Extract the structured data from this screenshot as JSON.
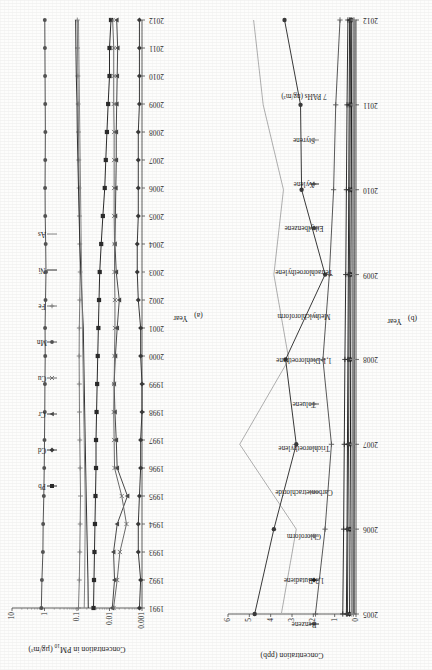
{
  "page": {
    "background": "#fdfdfc",
    "rotation_note": "figure rotated 90 degrees counter-clockwise on the scanned page"
  },
  "chart_data": [
    {
      "id": "a",
      "type": "line",
      "panel_tag": "(a)",
      "title": "",
      "xlabel": "Year",
      "ylabel": "Concentration in PM10 (µg/m³)",
      "yscale": "log",
      "ylim": [
        0.001,
        10
      ],
      "ytick_labels": [
        "10",
        "1",
        "0.1",
        "0.01",
        "0.001"
      ],
      "ytick_values": [
        10,
        1,
        0.1,
        0.01,
        0.001
      ],
      "grid": false,
      "legend_position": "top",
      "categories": [
        1991,
        1992,
        1993,
        1994,
        1995,
        1996,
        1997,
        1998,
        1999,
        2000,
        2001,
        2002,
        2003,
        2004,
        2005,
        2006,
        2007,
        2008,
        2009,
        2010,
        2011,
        2012
      ],
      "series": [
        {
          "name": "Pb",
          "color": "#2b2b2b",
          "marker": "square-filled",
          "values": [
            0.031,
            0.03,
            0.029,
            0.028,
            0.027,
            0.026,
            0.026,
            0.025,
            0.024,
            0.023,
            0.022,
            0.021,
            0.02,
            0.018,
            0.016,
            0.014,
            0.013,
            0.012,
            0.011,
            0.01,
            0.01,
            0.009
          ]
        },
        {
          "name": "Cd",
          "color": "#3a3a3a",
          "marker": "diamond-filled",
          "values": [
            0.0012,
            0.0011,
            0.0013,
            0.0013,
            0.0012,
            0.0011,
            0.0011,
            0.001,
            0.001,
            0.0011,
            0.0011,
            0.0013,
            0.0014,
            0.0014,
            0.0013,
            0.0013,
            0.0013,
            0.0013,
            0.0012,
            0.0012,
            0.0012,
            0.0012
          ]
        },
        {
          "name": "Cr",
          "color": "#4a4a4a",
          "marker": "triangle-filled",
          "values": [
            0.0082,
            0.007,
            0.0075,
            0.0058,
            0.0028,
            0.0058,
            0.0062,
            0.0068,
            0.0072,
            0.0066,
            0.0058,
            0.005,
            0.0062,
            0.0068,
            0.0066,
            0.0064,
            0.0062,
            0.0062,
            0.006,
            0.0058,
            0.0056,
            0.006
          ]
        },
        {
          "name": "Cu",
          "color": "#6b6b6b",
          "marker": "cross",
          "values": [
            0.0075,
            0.0058,
            0.0048,
            0.003,
            0.0042,
            0.007,
            0.0072,
            0.0074,
            0.0072,
            0.007,
            0.0068,
            0.0068,
            0.007,
            0.007,
            0.0072,
            0.0072,
            0.0072,
            0.0072,
            0.0074,
            0.0074,
            0.0074,
            0.008
          ]
        },
        {
          "name": "Mn",
          "color": "#545454",
          "marker": "circle-filled",
          "values": [
            1.25,
            1.2,
            1.12,
            1.1,
            1.05,
            1.02,
            1.0,
            0.98,
            0.97,
            0.95,
            0.96,
            0.93,
            0.9,
            0.92,
            0.95,
            0.96,
            0.95,
            0.94,
            0.95,
            0.96,
            0.97,
            0.98
          ]
        },
        {
          "name": "Fe",
          "color": "#7a7a7a",
          "marker": "plus",
          "values": [
            0.09,
            0.085,
            0.082,
            0.08,
            0.078,
            0.08,
            0.082,
            0.084,
            0.085,
            0.086,
            0.085,
            0.082,
            0.08,
            0.082,
            0.084,
            0.086,
            0.088,
            0.09,
            0.092,
            0.094,
            0.096,
            0.098
          ]
        },
        {
          "name": "Ni",
          "color": "#333333",
          "marker": "line",
          "values": [
            0.045,
            0.046,
            0.048,
            0.05,
            0.052,
            0.054,
            0.056,
            0.058,
            0.06,
            0.062,
            0.064,
            0.07,
            0.076,
            0.082,
            0.086,
            0.09,
            0.094,
            0.098,
            0.1,
            0.105,
            0.108,
            0.11
          ]
        },
        {
          "name": "As",
          "color": "#888888",
          "marker": "line",
          "values": [
            0.06,
            0.058,
            0.057,
            0.056,
            0.056,
            0.058,
            0.06,
            0.062,
            0.064,
            0.066,
            0.068,
            0.07,
            0.072,
            0.074,
            0.076,
            0.078,
            0.08,
            0.082,
            0.084,
            0.086,
            0.088,
            0.09
          ]
        }
      ]
    },
    {
      "id": "b",
      "type": "line",
      "panel_tag": "(b)",
      "title": "",
      "xlabel": "Year",
      "ylabel": "Concentration (ppb)",
      "yscale": "linear",
      "ylim": [
        0,
        6
      ],
      "ytick_labels": [
        "0",
        "1",
        "2",
        "3",
        "4",
        "5",
        "6"
      ],
      "ytick_values": [
        0,
        1,
        2,
        3,
        4,
        5,
        6
      ],
      "grid": false,
      "legend_position": "top",
      "categories": [
        2005,
        2006,
        2007,
        2008,
        2009,
        2010,
        2011,
        2012
      ],
      "series": [
        {
          "name": "Benzene",
          "color": "#2b2b2b",
          "marker": "plus",
          "values": [
            0.45,
            0.42,
            0.4,
            0.38,
            0.36,
            0.34,
            0.32,
            0.3
          ]
        },
        {
          "name": "1,3-Butadiene",
          "color": "#1f1f1f",
          "marker": "diamond-filled",
          "values": [
            0.3,
            0.28,
            0.26,
            0.25,
            0.24,
            0.22,
            0.21,
            0.2
          ]
        },
        {
          "name": "Chloroform",
          "color": "#6e6e6e",
          "marker": "plus",
          "values": [
            0.12,
            0.12,
            0.11,
            0.11,
            0.1,
            0.1,
            0.1,
            0.09
          ]
        },
        {
          "name": "Carbontetrachloride",
          "color": "#4b4b4b",
          "marker": "line",
          "values": [
            0.1,
            0.1,
            0.1,
            0.1,
            0.1,
            0.1,
            0.1,
            0.1
          ]
        },
        {
          "name": "Trichloroethylene",
          "color": "#8a8a8a",
          "marker": "line",
          "values": [
            0.22,
            0.2,
            0.18,
            0.16,
            0.15,
            0.14,
            0.13,
            0.12
          ]
        },
        {
          "name": "Toluene",
          "color": "#595959",
          "marker": "plus",
          "values": [
            1.9,
            1.45,
            1.15,
            1.55,
            1.25,
            1.05,
            0.95,
            0.75
          ]
        },
        {
          "name": "1,1-Dichloroethane",
          "color": "#5f5f5f",
          "marker": "line",
          "values": [
            0.08,
            0.08,
            0.07,
            0.07,
            0.06,
            0.06,
            0.06,
            0.05
          ]
        },
        {
          "name": "Methylchloroform",
          "color": "#777777",
          "marker": "line",
          "values": [
            0.14,
            0.12,
            0.1,
            0.09,
            0.08,
            0.07,
            0.06,
            0.05
          ]
        },
        {
          "name": "Tetrachloroethylene",
          "color": "#9a9a9a",
          "marker": "line",
          "values": [
            0.18,
            0.16,
            0.14,
            0.13,
            0.12,
            0.11,
            0.1,
            0.09
          ]
        },
        {
          "name": "Ethylbenzene",
          "color": "#3d3d3d",
          "marker": "diamond-filled",
          "values": [
            0.4,
            0.38,
            0.35,
            0.33,
            0.31,
            0.29,
            0.27,
            0.25
          ]
        },
        {
          "name": "Xylene",
          "color": "#2f2f2f",
          "marker": "plus",
          "values": [
            0.62,
            0.58,
            0.55,
            0.52,
            0.48,
            0.45,
            0.42,
            0.38
          ]
        },
        {
          "name": "Styrene",
          "color": "#8f8f8f",
          "marker": "plus",
          "values": [
            0.2,
            0.19,
            0.18,
            0.17,
            0.16,
            0.15,
            0.14,
            0.13
          ]
        },
        {
          "name": "7 PAHs (ng/m³)",
          "color": "#b0b0b0",
          "marker": "line",
          "values": [
            3.5,
            2.8,
            5.45,
            3.15,
            3.85,
            3.4,
            4.35,
            4.8
          ]
        }
      ],
      "extra_series": [
        {
          "name": "Toluene-high",
          "color": "#3a3a3a",
          "marker": "circle-filled",
          "values": [
            4.75,
            3.85,
            2.8,
            3.3,
            1.45,
            2.55,
            2.6,
            3.35
          ]
        }
      ]
    }
  ]
}
